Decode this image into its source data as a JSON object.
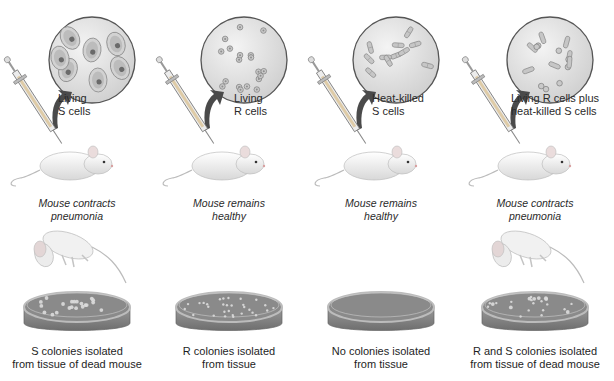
{
  "experiment": "Griffith transformation experiment",
  "colors": {
    "magnifier_fill": "#e4e4e4",
    "magnifier_stroke": "#555555",
    "arrow": "#4a4a4a",
    "agar": "#8a8a8a",
    "dish_rim": "#b9b9b9",
    "mouse": "#f2f2f2",
    "text": "#2a2a2a"
  },
  "panels": [
    {
      "id": "living-s",
      "cell_label": [
        "Living",
        "S cells"
      ],
      "cell_type": "encapsulated-smooth",
      "outcome": [
        "Mouse contracts",
        "pneumonia"
      ],
      "mouse_dead": true,
      "colonies": "S",
      "result": [
        "S colonies isolated",
        "from tissue of dead mouse"
      ]
    },
    {
      "id": "living-r",
      "cell_label": [
        "Living",
        "R cells"
      ],
      "cell_type": "rough",
      "outcome": [
        "Mouse remains",
        "healthy"
      ],
      "mouse_dead": false,
      "colonies": "R",
      "result": [
        "R colonies isolated",
        "from tissue"
      ]
    },
    {
      "id": "heat-killed-s",
      "cell_label": [
        "Heat-killed",
        "S cells"
      ],
      "cell_type": "heat-killed",
      "outcome": [
        "Mouse remains",
        "healthy"
      ],
      "mouse_dead": false,
      "colonies": "none",
      "result": [
        "No colonies isolated",
        "from tissue"
      ]
    },
    {
      "id": "r-plus-heat-killed-s",
      "cell_label": [
        "Living R cells plus",
        "heat-killed S cells"
      ],
      "cell_type": "mixed",
      "outcome": [
        "Mouse contracts",
        "pneumonia"
      ],
      "mouse_dead": true,
      "colonies": "R and S",
      "result": [
        "R and S colonies isolated",
        "from tissue of dead mouse"
      ]
    }
  ]
}
